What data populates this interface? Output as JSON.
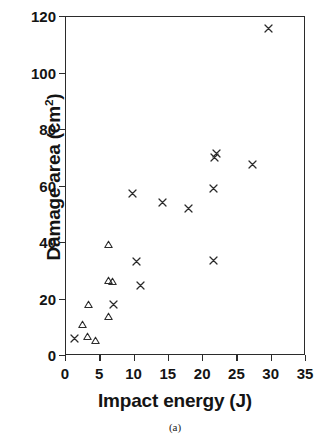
{
  "figure": {
    "caption": "(a)",
    "ylabel_text": "Damage area (cm",
    "ylabel_sup": "2",
    "ylabel_tail": ")",
    "xlabel": "Impact energy (J)"
  },
  "chart_data": {
    "type": "scatter",
    "title": "",
    "xlabel": "Impact energy (J)",
    "ylabel": "Damage area (cm2)",
    "caption": "(a)",
    "xlim": [
      0,
      35
    ],
    "ylim": [
      0,
      120
    ],
    "xticks": [
      0,
      5,
      10,
      15,
      20,
      25,
      30,
      35
    ],
    "yticks": [
      0,
      20,
      40,
      60,
      80,
      100,
      120
    ],
    "xtick_labels": [
      "0",
      "5",
      "10",
      "15",
      "20",
      "25",
      "30",
      "35"
    ],
    "ytick_labels": [
      "0",
      "20",
      "40",
      "60",
      "80",
      "100",
      "120"
    ],
    "grid": false,
    "legend": null,
    "marker_color": "#2b2b2b",
    "series": [
      {
        "name": "cross-series",
        "marker": "x",
        "points": [
          {
            "x": 1.4,
            "y": 5.8
          },
          {
            "x": 7.1,
            "y": 17.8
          },
          {
            "x": 9.9,
            "y": 57.0
          },
          {
            "x": 10.4,
            "y": 33.0
          },
          {
            "x": 11.0,
            "y": 24.5
          },
          {
            "x": 14.2,
            "y": 54.0
          },
          {
            "x": 18.0,
            "y": 52.0
          },
          {
            "x": 21.6,
            "y": 33.5
          },
          {
            "x": 21.7,
            "y": 59.0
          },
          {
            "x": 21.8,
            "y": 70.0
          },
          {
            "x": 22.1,
            "y": 71.2
          },
          {
            "x": 27.4,
            "y": 67.5
          },
          {
            "x": 29.7,
            "y": 115.5
          }
        ]
      },
      {
        "name": "triangle-series",
        "marker": "triangle-up",
        "points": [
          {
            "x": 2.6,
            "y": 10.8
          },
          {
            "x": 3.3,
            "y": 6.6
          },
          {
            "x": 3.4,
            "y": 18.0
          },
          {
            "x": 4.4,
            "y": 5.0
          },
          {
            "x": 6.3,
            "y": 13.7
          },
          {
            "x": 6.4,
            "y": 26.3
          },
          {
            "x": 6.4,
            "y": 39.0
          },
          {
            "x": 6.9,
            "y": 26.0
          }
        ]
      }
    ]
  }
}
